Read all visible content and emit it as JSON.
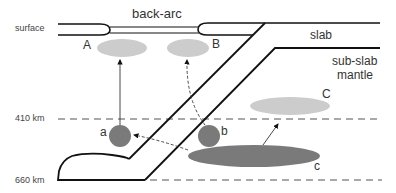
{
  "diagram": {
    "depth_labels": {
      "surface": "surface",
      "d410": "410 km",
      "d660": "660 km"
    },
    "region_labels": {
      "back_arc": "back-arc",
      "slab": "slab",
      "sub_slab_line1": "sub-slab",
      "sub_slab_line2": "mantle"
    },
    "reservoirs": {
      "A": "A",
      "B": "B",
      "C": "C",
      "a": "a",
      "b": "b",
      "c": "c"
    },
    "colors": {
      "line": "#111111",
      "light_gray": "#cccccc",
      "dark_gray": "#7a7a7a",
      "dashed": "#555555"
    }
  }
}
